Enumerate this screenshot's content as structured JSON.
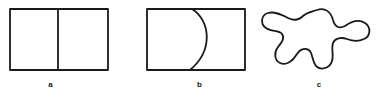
{
  "figure_panel": {
    "background_color": "#ffffff",
    "stroke_color": "#1a1a1a",
    "figures": [
      {
        "id": "a",
        "label": "a",
        "caption_label": "a",
        "shape": "rectangle-with-vertical-divider",
        "description": "Rectangle split into two equal cells by a single vertical line",
        "stroke_width": 1.8,
        "rect": {
          "x": 10,
          "y": 9,
          "width": 98,
          "height": 61
        },
        "divider_x": 58
      },
      {
        "id": "b",
        "label": "b",
        "caption_label": "b",
        "shape": "rectangle-with-bulging-arc",
        "description": "Rectangle divided by a curve that bulges to the right",
        "stroke_width": 1.8,
        "rect": {
          "x": 17,
          "y": 9,
          "width": 98,
          "height": 61
        },
        "arc": {
          "start_x": 62,
          "start_y": 9,
          "end_x": 60,
          "end_y": 70,
          "apex_x": 82
        }
      },
      {
        "id": "c",
        "label": "c",
        "caption_label": "c",
        "shape": "irregular-blob",
        "description": "Closed irregular amoeba-like curve with several rounded lobes",
        "stroke_width": 1.8,
        "bounds": {
          "x": 6,
          "y": 9,
          "width": 110,
          "height": 63
        }
      }
    ]
  }
}
